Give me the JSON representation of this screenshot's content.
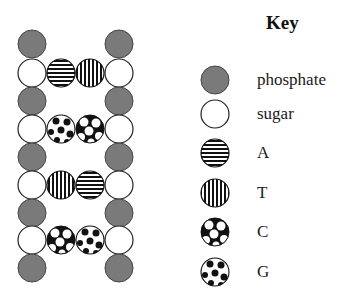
{
  "key": {
    "title": "Key",
    "items": [
      {
        "id": "phosphate",
        "label": "phosphate",
        "pattern": "phosphate"
      },
      {
        "id": "sugar",
        "label": "sugar",
        "pattern": "sugar"
      },
      {
        "id": "A",
        "label": "A",
        "pattern": "hstripes"
      },
      {
        "id": "T",
        "label": "T",
        "pattern": "vstripes"
      },
      {
        "id": "C",
        "label": "C",
        "pattern": "bigdots"
      },
      {
        "id": "G",
        "label": "G",
        "pattern": "smalldots"
      }
    ]
  },
  "dna": {
    "rows": [
      {
        "type": "phosphate"
      },
      {
        "type": "sugar",
        "left_base": "A",
        "right_base": "T"
      },
      {
        "type": "phosphate"
      },
      {
        "type": "sugar",
        "left_base": "G",
        "right_base": "C"
      },
      {
        "type": "phosphate"
      },
      {
        "type": "sugar",
        "left_base": "T",
        "right_base": "A"
      },
      {
        "type": "phosphate"
      },
      {
        "type": "sugar",
        "left_base": "C",
        "right_base": "G"
      },
      {
        "type": "phosphate"
      }
    ]
  },
  "colors": {
    "phosphate_fill": "#7a7a7a",
    "outline": "#222222",
    "background": "#ffffff"
  }
}
